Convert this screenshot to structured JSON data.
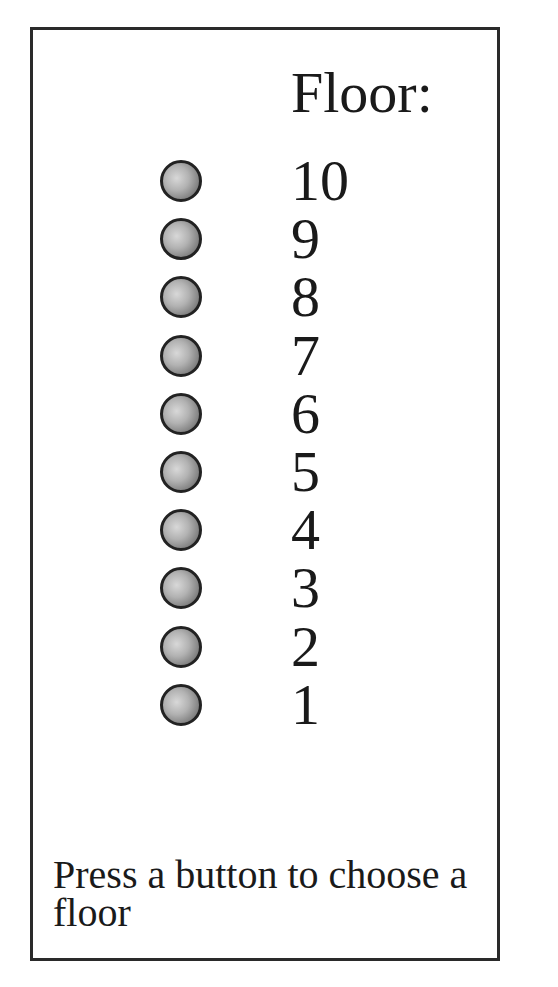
{
  "panel": {
    "title": "Floor:",
    "floors": [
      {
        "label": "10",
        "button_icon": "round-button"
      },
      {
        "label": "9",
        "button_icon": "round-button"
      },
      {
        "label": "8",
        "button_icon": "round-button"
      },
      {
        "label": "7",
        "button_icon": "round-button"
      },
      {
        "label": "6",
        "button_icon": "round-button"
      },
      {
        "label": "5",
        "button_icon": "round-button"
      },
      {
        "label": "4",
        "button_icon": "round-button"
      },
      {
        "label": "3",
        "button_icon": "round-button"
      },
      {
        "label": "2",
        "button_icon": "round-button"
      },
      {
        "label": "1",
        "button_icon": "round-button"
      }
    ],
    "status_message": "Press a button to choose a floor"
  },
  "colors": {
    "border": "#2a2a2a",
    "text": "#1a1a1a",
    "button_light": "#d8d8d8",
    "button_dark": "#555555",
    "background": "#ffffff"
  }
}
